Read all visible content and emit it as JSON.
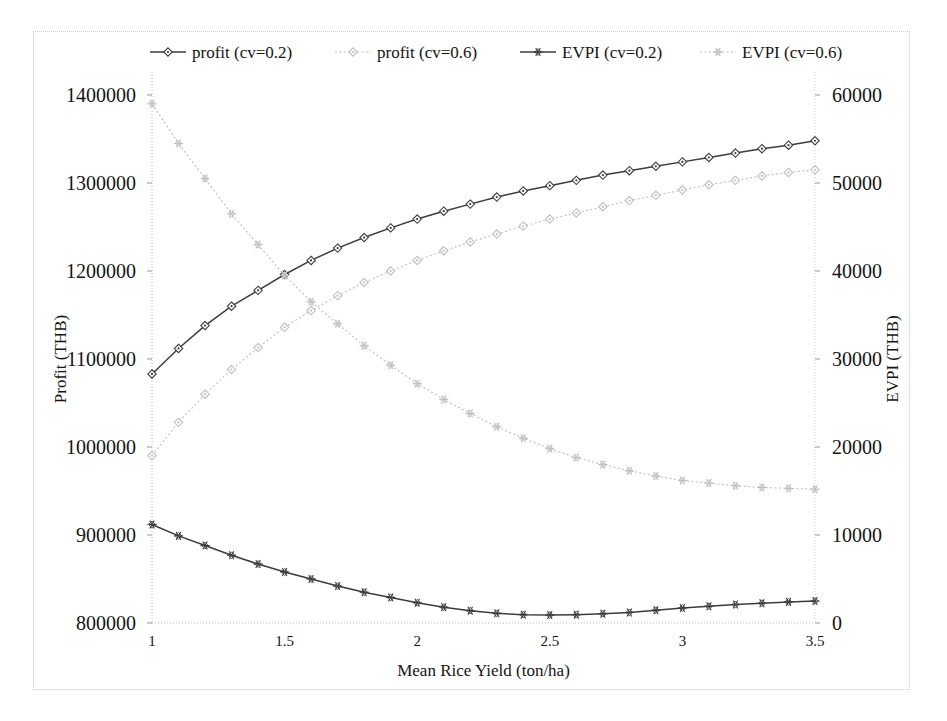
{
  "figure": {
    "background_color": "#ffffff",
    "border_color": "#c9c9c9"
  },
  "chart_data": {
    "type": "line",
    "title": "",
    "xlabel": "Mean Rice Yield (ton/ha)",
    "ylabel": "Profit (THB)",
    "y2label": "EVPI (THB)",
    "xlim": [
      1,
      3.5
    ],
    "ylim": [
      800000,
      1400000
    ],
    "y2lim": [
      0,
      60000
    ],
    "xticks": [
      "1",
      "1.5",
      "2",
      "2.5",
      "3",
      "3.5"
    ],
    "xtick_values": [
      1,
      1.5,
      2,
      2.5,
      3,
      3.5
    ],
    "yticks": [
      "800000",
      "900000",
      "1000000",
      "1100000",
      "1200000",
      "1300000",
      "1400000"
    ],
    "ytick_values": [
      800000,
      900000,
      1000000,
      1100000,
      1200000,
      1300000,
      1400000
    ],
    "y2ticks": [
      "0",
      "10000",
      "20000",
      "30000",
      "40000",
      "50000",
      "60000"
    ],
    "y2tick_values": [
      0,
      10000,
      20000,
      30000,
      40000,
      50000,
      60000
    ],
    "grid": false,
    "legend_position": "top",
    "x": [
      1,
      1.1,
      1.2,
      1.3,
      1.4,
      1.5,
      1.6,
      1.7,
      1.8,
      1.9,
      2,
      2.1,
      2.2,
      2.3,
      2.4,
      2.5,
      2.6,
      2.7,
      2.8,
      2.9,
      3,
      3.1,
      3.2,
      3.3,
      3.4,
      3.5
    ],
    "series": [
      {
        "name": "profit (cv=0.2)",
        "axis": "left",
        "color": "#3c3c3c",
        "line_style": "solid",
        "marker": "diamond",
        "values": [
          1083000,
          1112000,
          1138000,
          1160000,
          1178000,
          1196000,
          1212000,
          1226000,
          1238000,
          1249000,
          1259000,
          1268000,
          1276000,
          1284000,
          1291000,
          1297000,
          1303000,
          1309000,
          1314000,
          1319000,
          1324000,
          1329000,
          1334000,
          1339000,
          1343000,
          1348000
        ]
      },
      {
        "name": "profit (cv=0.6)",
        "axis": "left",
        "color": "#bfbfbf",
        "line_style": "dotted",
        "marker": "diamond",
        "values": [
          990000,
          1028000,
          1060000,
          1088000,
          1113000,
          1136000,
          1155000,
          1172000,
          1187000,
          1200000,
          1212000,
          1223000,
          1233000,
          1242000,
          1251000,
          1259000,
          1266000,
          1273000,
          1280000,
          1286000,
          1292000,
          1298000,
          1303000,
          1308000,
          1312000,
          1315000
        ]
      },
      {
        "name": "EVPI (cv=0.2)",
        "axis": "right",
        "color": "#3c3c3c",
        "line_style": "solid",
        "marker": "star",
        "values": [
          11200,
          9900,
          8800,
          7700,
          6700,
          5800,
          5000,
          4200,
          3500,
          2900,
          2300,
          1800,
          1400,
          1100,
          950,
          900,
          950,
          1050,
          1200,
          1450,
          1700,
          1900,
          2100,
          2250,
          2400,
          2500
        ]
      },
      {
        "name": "EVPI (cv=0.6)",
        "axis": "right",
        "color": "#bfbfbf",
        "line_style": "dotted",
        "marker": "star",
        "values": [
          59000,
          54500,
          50500,
          46500,
          43000,
          39500,
          36500,
          34000,
          31500,
          29300,
          27200,
          25400,
          23800,
          22300,
          21000,
          19800,
          18800,
          18000,
          17300,
          16700,
          16200,
          15900,
          15600,
          15400,
          15300,
          15200
        ]
      }
    ]
  },
  "legend": {
    "items": [
      {
        "label": "profit (cv=0.2)"
      },
      {
        "label": "profit (cv=0.6)"
      },
      {
        "label": "EVPI (cv=0.2)"
      },
      {
        "label": "EVPI (cv=0.6)"
      }
    ]
  }
}
